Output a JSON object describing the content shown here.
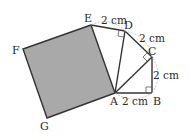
{
  "diagram": {
    "type": "geometry",
    "points": {
      "A": {
        "label": "A",
        "x": 115,
        "y": 93
      },
      "B": {
        "label": "B",
        "x": 152,
        "y": 93
      },
      "C": {
        "label": "C",
        "x": 152,
        "y": 57
      },
      "D": {
        "label": "D",
        "x": 125,
        "y": 31
      },
      "E": {
        "label": "E",
        "x": 91,
        "y": 25
      },
      "F": {
        "label": "F",
        "x": 23,
        "y": 49
      },
      "G": {
        "label": "G",
        "x": 47,
        "y": 118
      }
    },
    "lengths": {
      "AB": "2 cm",
      "BC": "2 cm",
      "CD": "2 cm",
      "DE": "2 cm"
    },
    "right_angles": [
      "B",
      "C",
      "D"
    ],
    "shaded_region": "square AEFG",
    "colors": {
      "shade": "#a9a9a9",
      "line": "#333333",
      "arc": "#b5b5b5"
    }
  }
}
